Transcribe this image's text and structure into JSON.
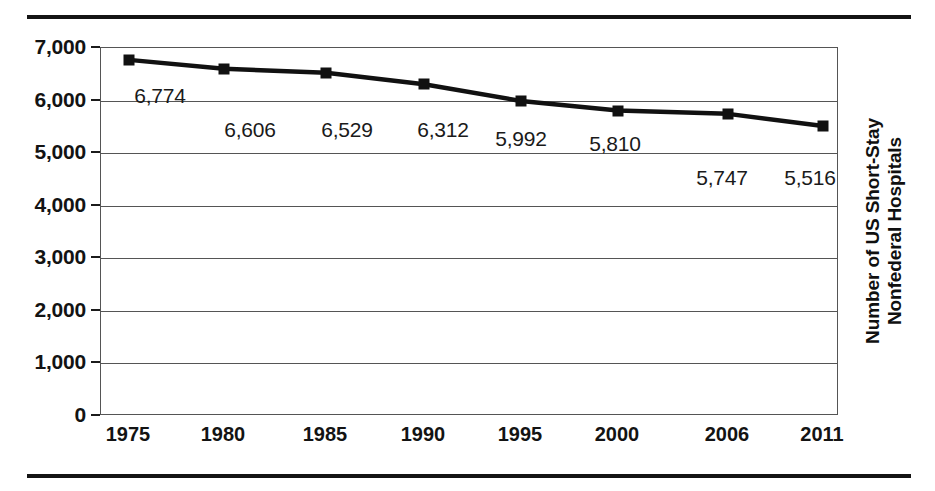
{
  "chart_data": {
    "type": "line",
    "title": "",
    "subtitle": "",
    "xlabel": "",
    "ylabel": "Number of US Short-Stay Nonfederal Hospitals",
    "ylabel_lines": [
      "Number of US Short-Stay",
      "Nonfederal Hospitals"
    ],
    "categories": [
      "1975",
      "1980",
      "1985",
      "1990",
      "1995",
      "2000",
      "2006",
      "2011"
    ],
    "values": [
      6774,
      6606,
      6529,
      6312,
      5992,
      5810,
      5747,
      5516
    ],
    "point_labels": [
      "6,774",
      "6,606",
      "6,529",
      "6,312",
      "5,992",
      "5,810",
      "5,747",
      "5,516"
    ],
    "ylim": [
      0,
      7000
    ],
    "ytick_values": [
      0,
      1000,
      2000,
      3000,
      4000,
      5000,
      6000,
      7000
    ],
    "ytick_labels": [
      "0",
      "1,000",
      "2,000",
      "3,000",
      "4,000",
      "5,000",
      "6,000",
      "7,000"
    ],
    "grid": true,
    "legend": "none",
    "marker": "square",
    "series_color": "#111111",
    "grid_color": "#555555",
    "text_color": "#131313"
  }
}
